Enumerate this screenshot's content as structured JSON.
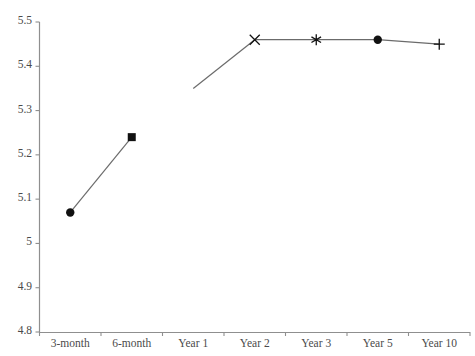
{
  "chart_data": {
    "type": "line",
    "title": "",
    "clipped_header_text": "",
    "xlabel": "",
    "ylabel": "",
    "categories": [
      "3-month",
      "6-month",
      "Year 1",
      "Year 2",
      "Year 3",
      "Year 5",
      "Year 10"
    ],
    "values": [
      5.07,
      5.24,
      5.35,
      5.46,
      5.46,
      5.46,
      5.45
    ],
    "markers": [
      "filled-circle",
      "filled-square",
      "none",
      "cross",
      "asterisk",
      "filled-circle",
      "plus"
    ],
    "ylim": [
      4.8,
      5.5
    ],
    "ytick_labels": [
      "5.5",
      "5.4",
      "5.3",
      "5.2",
      "5.1",
      "5",
      "4.9",
      "4.8"
    ],
    "ytick_values": [
      5.5,
      5.4,
      5.3,
      5.2,
      5.1,
      5.0,
      4.9,
      4.8
    ],
    "grid": false,
    "legend": "none",
    "line_color": "#6b6b6b",
    "marker_color": "#111111",
    "axis_color": "#8f8f8f",
    "series": [
      {
        "name": "series-1",
        "values": [
          5.07,
          5.24,
          5.35,
          5.46,
          5.46,
          5.46,
          5.45
        ]
      }
    ]
  }
}
